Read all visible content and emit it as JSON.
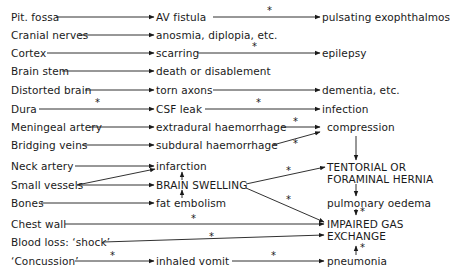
{
  "diagram": {
    "type": "flowchart",
    "left_column": [
      "Pit. fossa",
      "Cranial nerves",
      "Cortex",
      "Brain stem",
      "Distorted brain",
      "Dura",
      "Meningeal artery",
      "Bridging veins",
      "Neck artery",
      "Small vessels",
      "Bones",
      "Chest wall",
      "Blood loss: ‘shock’",
      "‘Concussion’"
    ],
    "middle_column": [
      "AV fistula",
      "anosmia, diplopia, etc.",
      "scarring",
      "death or disablement",
      "torn axons",
      "CSF leak",
      "extradural haemorrhage",
      "subdural haemorrhage",
      "infarction",
      "BRAIN SWELLING",
      "fat embolism",
      "inhaled vomit"
    ],
    "right_column": [
      "pulsating exophthalmos",
      "epilepsy",
      "dementia, etc.",
      "infection",
      "compression",
      "TENTORIAL OR",
      "FORAMINAL HERNIA",
      "pulmonary oedema",
      "IMPAIRED GAS",
      "EXCHANGE",
      "pneumonia"
    ],
    "star_marker": "*",
    "edges": [
      {
        "from": "Pit. fossa",
        "to": "AV fistula"
      },
      {
        "from": "AV fistula",
        "to": "pulsating exophthalmos",
        "starred": true
      },
      {
        "from": "Cranial nerves",
        "to": "anosmia, diplopia, etc."
      },
      {
        "from": "Cortex",
        "to": "scarring"
      },
      {
        "from": "scarring",
        "to": "epilepsy",
        "starred": true
      },
      {
        "from": "Brain stem",
        "to": "death or disablement"
      },
      {
        "from": "Distorted brain",
        "to": "torn axons"
      },
      {
        "from": "torn axons",
        "to": "dementia, etc."
      },
      {
        "from": "Dura",
        "to": "CSF leak",
        "starred": true
      },
      {
        "from": "CSF leak",
        "to": "infection",
        "starred": true
      },
      {
        "from": "Meningeal artery",
        "to": "extradural haemorrhage"
      },
      {
        "from": "extradural haemorrhage",
        "to": "compression",
        "starred": true
      },
      {
        "from": "Bridging veins",
        "to": "subdural haemorrhage"
      },
      {
        "from": "subdural haemorrhage",
        "to": "compression",
        "starred": true
      },
      {
        "from": "compression",
        "to": "TENTORIAL OR FORAMINAL HERNIA"
      },
      {
        "from": "Neck artery",
        "to": "infarction"
      },
      {
        "from": "Small vessels",
        "to": "infarction"
      },
      {
        "from": "Small vessels",
        "to": "BRAIN SWELLING"
      },
      {
        "from": "Bones",
        "to": "fat embolism"
      },
      {
        "from": "infarction",
        "to": "BRAIN SWELLING"
      },
      {
        "from": "fat embolism",
        "to": "BRAIN SWELLING"
      },
      {
        "from": "BRAIN SWELLING",
        "to": "TENTORIAL OR FORAMINAL HERNIA",
        "starred": true
      },
      {
        "from": "BRAIN SWELLING",
        "to": "IMPAIRED GAS EXCHANGE",
        "starred": true
      },
      {
        "from": "TENTORIAL OR FORAMINAL HERNIA",
        "to": "pulmonary oedema"
      },
      {
        "from": "pulmonary oedema",
        "to": "IMPAIRED GAS EXCHANGE",
        "starred": true
      },
      {
        "from": "Chest wall",
        "to": "IMPAIRED GAS EXCHANGE",
        "starred": true
      },
      {
        "from": "Blood loss: ‘shock’",
        "to": "IMPAIRED GAS EXCHANGE",
        "starred": true
      },
      {
        "from": "‘Concussion’",
        "to": "inhaled vomit",
        "starred": true
      },
      {
        "from": "inhaled vomit",
        "to": "pneumonia",
        "starred": true
      },
      {
        "from": "pneumonia",
        "to": "IMPAIRED GAS EXCHANGE",
        "starred": true
      }
    ]
  }
}
